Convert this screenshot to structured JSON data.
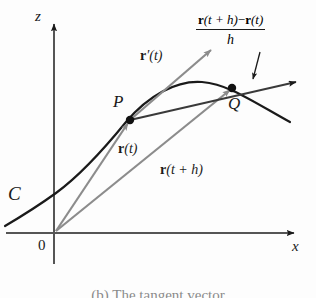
{
  "figure": {
    "caption": "(b) The tangent vector",
    "axes": {
      "z_label": "z",
      "x_label": "x",
      "origin_label": "0"
    },
    "curve": {
      "label": "C",
      "color": "#1a1a1a"
    },
    "points": [
      {
        "name": "P",
        "label": "P"
      },
      {
        "name": "Q",
        "label": "Q"
      }
    ],
    "vectors": [
      {
        "name": "position-vector-t",
        "r": "r",
        "arg_open": "(",
        "arg": "t",
        "arg_close": ")",
        "color": "#8c8c8c"
      },
      {
        "name": "position-vector-t-plus-h",
        "r": "r",
        "arg_open": "(",
        "arg": "t + h",
        "arg_close": ")",
        "color": "#8c8c8c"
      },
      {
        "name": "derivative-vector",
        "r": "r",
        "prime": "′",
        "arg_open": "(",
        "arg": "t",
        "arg_close": ")",
        "color": "#8c8c8c"
      }
    ],
    "difference_quotient": {
      "numerator_r1": "r",
      "numerator_arg1": "(t + h)",
      "numerator_minus": "−",
      "numerator_r2": "r",
      "numerator_arg2": "(t)",
      "denominator": "h"
    },
    "colors": {
      "ink": "#1a1a1a",
      "gray_vector": "#8c8c8c",
      "axis": "#555555",
      "background": "#fdfdfd"
    }
  }
}
